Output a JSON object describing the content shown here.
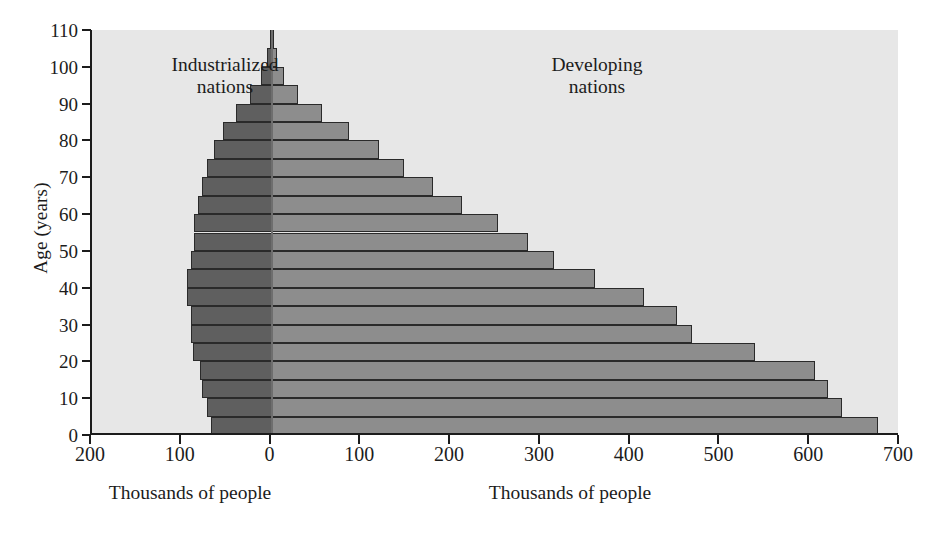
{
  "chart_data": {
    "type": "bar",
    "subtype": "population-pyramid",
    "title": "",
    "orientation": "horizontal",
    "xlabel": "Thousands of people",
    "ylabel": "Age (years)",
    "xlabel_left": "Thousands of people",
    "xlabel_right": "Thousands of people",
    "panel_label_left": "Industrialized\nnations",
    "panel_label_right": "Developing\nnations",
    "grid": false,
    "legend": "none",
    "plot_background": "#e7e7e7",
    "color_left": "#5f5f5f",
    "color_right": "#8d8d8d",
    "axis_color": "#1c1c1c",
    "ylim": [
      0,
      110
    ],
    "y_ticks": [
      0,
      10,
      20,
      30,
      40,
      50,
      60,
      70,
      80,
      90,
      100,
      110
    ],
    "y_tick_labels": [
      "0",
      "10",
      "20",
      "30",
      "40",
      "50",
      "60",
      "70",
      "80",
      "90",
      "100",
      "110"
    ],
    "x_axis_left_max": 200,
    "x_axis_right_max": 700,
    "x_ticks_values": [
      -200,
      -100,
      0,
      100,
      200,
      300,
      400,
      500,
      600,
      700
    ],
    "x_tick_labels": [
      "200",
      "100",
      "0",
      "100",
      "200",
      "300",
      "400",
      "500",
      "600",
      "700"
    ],
    "age_bin_width": 5,
    "categories": [
      "0-5",
      "5-10",
      "10-15",
      "15-20",
      "20-25",
      "25-30",
      "30-35",
      "35-40",
      "40-45",
      "45-50",
      "50-55",
      "55-60",
      "60-65",
      "65-70",
      "70-75",
      "75-80",
      "80-85",
      "85-90",
      "90-95",
      "95-100",
      "100-105",
      "105-110"
    ],
    "age_bin_starts": [
      0,
      5,
      10,
      15,
      20,
      25,
      30,
      35,
      40,
      45,
      50,
      55,
      60,
      65,
      70,
      75,
      80,
      85,
      90,
      95,
      100,
      105
    ],
    "series": [
      {
        "name": "Industrialized nations",
        "side": "left",
        "units": "thousands of people",
        "values": [
          68,
          72,
          78,
          80,
          88,
          90,
          90,
          94,
          94,
          90,
          86,
          86,
          82,
          78,
          72,
          64,
          54,
          40,
          24,
          12,
          5,
          2
        ]
      },
      {
        "name": "Developing nations",
        "side": "right",
        "units": "thousands of people",
        "values": [
          675,
          635,
          620,
          605,
          538,
          468,
          452,
          415,
          360,
          315,
          286,
          252,
          212,
          180,
          148,
          120,
          86,
          56,
          30,
          14,
          6,
          2
        ]
      }
    ]
  }
}
